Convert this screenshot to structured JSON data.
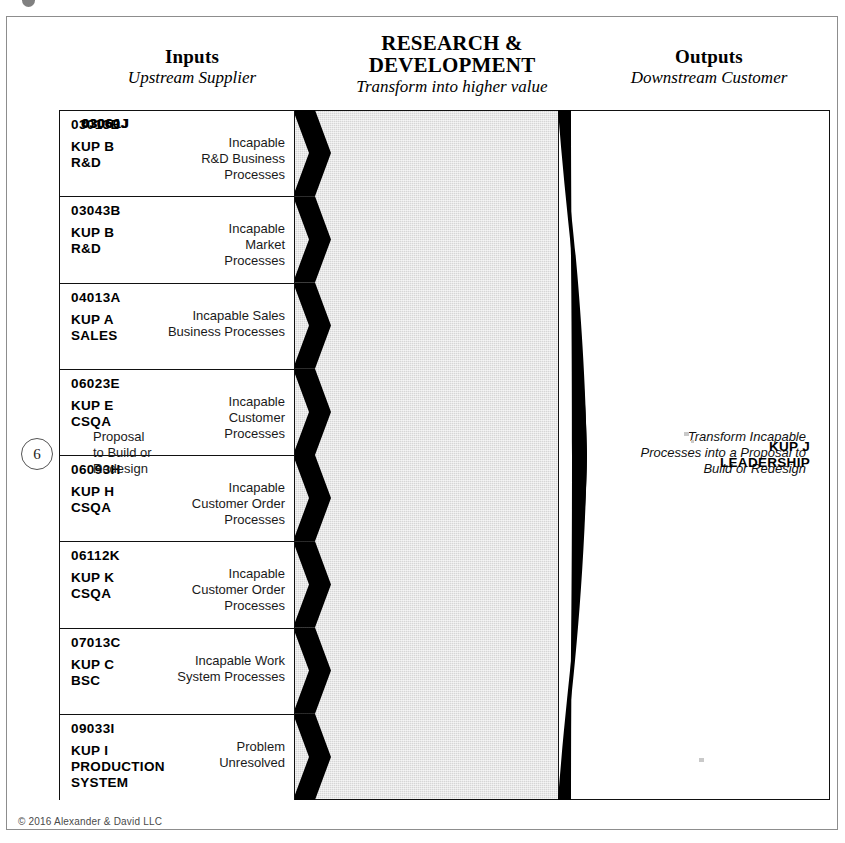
{
  "marker": {
    "step_number": "6"
  },
  "headers": {
    "inputs": {
      "title": "Inputs",
      "subtitle": "Upstream Supplier"
    },
    "center": {
      "title": "RESEARCH &\nDEVELOPMENT",
      "title_line1": "RESEARCH &",
      "title_line2": "DEVELOPMENT",
      "subtitle": "Transform into higher value"
    },
    "outputs": {
      "title": "Outputs",
      "subtitle": "Downstream Customer"
    }
  },
  "inputs": {
    "rows": [
      {
        "code": "03013B",
        "kup": "KUP B\nR&D",
        "description": "Incapable\nR&D Business\nProcesses"
      },
      {
        "code": "03043B",
        "kup": "KUP B\nR&D",
        "description": "Incapable\nMarket\nProcesses"
      },
      {
        "code": "04013A",
        "kup": "KUP A\nSALES",
        "description": "Incapable Sales\nBusiness Processes"
      },
      {
        "code": "06023E",
        "kup": "KUP E\nCSQA",
        "description": "Incapable\nCustomer\nProcesses"
      },
      {
        "code": "06093H",
        "kup": "KUP H\nCSQA",
        "description": "Incapable\nCustomer Order\nProcesses"
      },
      {
        "code": "06112K",
        "kup": "KUP K\nCSQA",
        "description": "Incapable\nCustomer Order\nProcesses"
      },
      {
        "code": "07013C",
        "kup": "KUP C\nBSC",
        "description": "Incapable Work\nSystem Processes"
      },
      {
        "code": "09033I",
        "kup": "KUP I\nPRODUCTION\nSYSTEM",
        "description": "Problem\nUnresolved"
      }
    ]
  },
  "center": {
    "code": "03060J",
    "text": "Transform Incapable\nProcesses into a Proposal to\nBuild or Redesign"
  },
  "outputs": {
    "code": "03061J",
    "description": "Proposal\nto Build or\nRedesign",
    "kup": "KUP J\nLEADERSHIP"
  },
  "footer": {
    "copyright": "© 2016 Alexander & David LLC"
  },
  "colors": {
    "transform_fill": "#d6d6d6",
    "arrow_fill": "#000000",
    "border": "#111111",
    "page_background": "#ffffff"
  }
}
